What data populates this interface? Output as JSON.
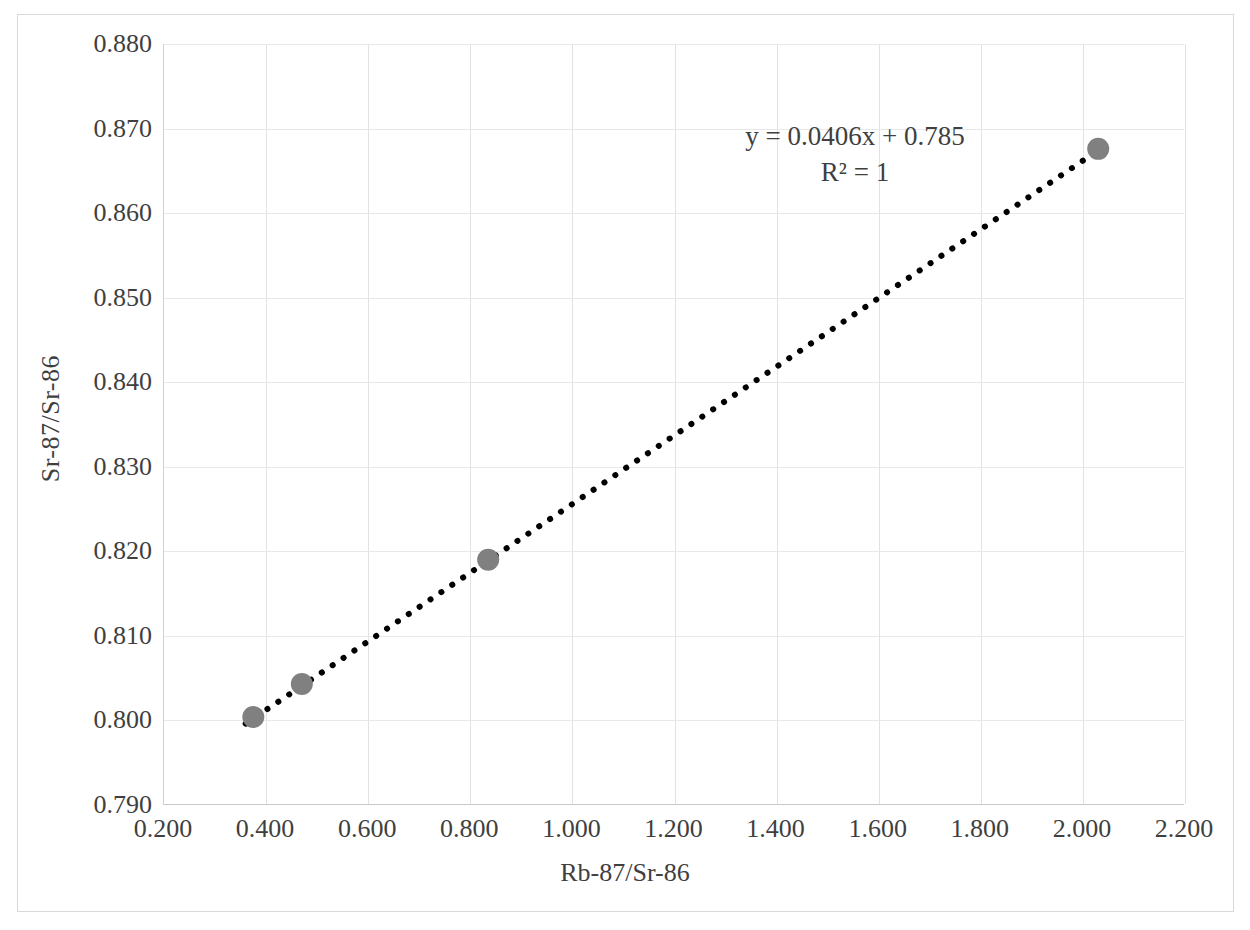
{
  "chart_data": {
    "type": "scatter",
    "title": "",
    "xlabel": "Rb-87/Sr-86",
    "ylabel": "Sr-87/Sr-86",
    "xlim": [
      0.2,
      2.2
    ],
    "ylim": [
      0.79,
      0.88
    ],
    "xticks": [
      "0.200",
      "0.400",
      "0.600",
      "0.800",
      "1.000",
      "1.200",
      "1.400",
      "1.600",
      "1.800",
      "2.000",
      "2.200"
    ],
    "xtick_values": [
      0.2,
      0.4,
      0.6,
      0.8,
      1.0,
      1.2,
      1.4,
      1.6,
      1.8,
      2.0,
      2.2
    ],
    "yticks": [
      "0.790",
      "0.800",
      "0.810",
      "0.820",
      "0.830",
      "0.840",
      "0.850",
      "0.860",
      "0.870",
      "0.880"
    ],
    "ytick_values": [
      0.79,
      0.8,
      0.81,
      0.82,
      0.83,
      0.84,
      0.85,
      0.86,
      0.87,
      0.88
    ],
    "grid": true,
    "legend": false,
    "series": [
      {
        "name": "Sr-87/Sr-86 vs Rb-87/Sr-86",
        "marker": "circle",
        "marker_color": "#808080",
        "x": [
          0.375,
          0.47,
          0.835,
          2.03
        ],
        "y": [
          0.8004,
          0.8043,
          0.819,
          0.8676
        ]
      }
    ],
    "trendline": {
      "type": "linear",
      "style": "dotted",
      "color": "#000000",
      "equation": "y = 0.0406x + 0.785",
      "r_squared_label": "R² = 1",
      "slope": 0.0406,
      "intercept": 0.785,
      "r_squared": 1,
      "x_start": 0.36,
      "x_end": 2.035
    },
    "annotations": [
      {
        "text": "y = 0.0406x + 0.785"
      },
      {
        "text": "R² = 1"
      }
    ]
  },
  "colors": {
    "marker": "#808080",
    "trendline": "#000000",
    "gridline": "#e2e2e2",
    "frame": "#d9d9d9",
    "text": "#3f3f3f",
    "background": "#ffffff"
  },
  "axis": {
    "x_title": "Rb-87/Sr-86",
    "y_title": "Sr-87/Sr-86"
  },
  "equation": {
    "line1": "y = 0.0406x + 0.785",
    "line2": "R² = 1"
  }
}
